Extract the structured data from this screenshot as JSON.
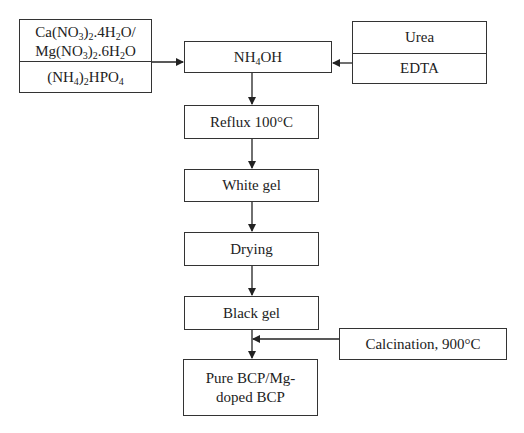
{
  "diagram": {
    "type": "flowchart",
    "inputs_left": {
      "top_line1": "Ca(NO3)2.4H2O/",
      "top_line2": "Mg(NO3)2.6H2O",
      "bottom": "(NH4)2HPO4"
    },
    "inputs_right": {
      "top": "Urea",
      "bottom": "EDTA"
    },
    "steps": [
      {
        "label": "NH4OH"
      },
      {
        "label": "Reflux 100°C"
      },
      {
        "label": "White gel"
      },
      {
        "label": "Drying"
      },
      {
        "label": "Black gel"
      },
      {
        "label_line1": "Pure BCP/Mg-",
        "label_line2": "doped BCP"
      }
    ],
    "side_input": {
      "label": "Calcination, 900°C"
    },
    "colors": {
      "line": "#222222",
      "background": "#ffffff"
    }
  }
}
